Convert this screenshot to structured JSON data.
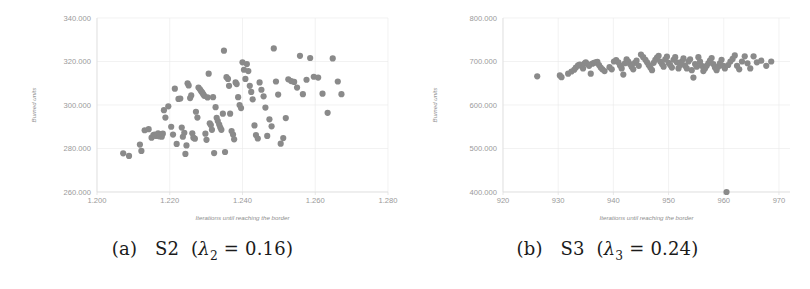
{
  "figure": {
    "panels": [
      {
        "id": "panel-a",
        "caption_label": "(a)",
        "caption_name": "S2",
        "caption_lambda": "λ",
        "caption_lambda_sub": "2",
        "caption_eq": "= 0.16",
        "caption_full": "(a) S2 (λ2 = 0.16)"
      },
      {
        "id": "panel-b",
        "caption_label": "(b)",
        "caption_name": "S3",
        "caption_lambda": "λ",
        "caption_lambda_sub": "3",
        "caption_eq": "= 0.24",
        "caption_full": "(b) S3 (λ3 = 0.24)"
      }
    ]
  },
  "colors": {
    "point": "#8a8a8a",
    "grid": "#e9e9e9",
    "axis": "#dddddd",
    "tick_text": "#9a9a9a",
    "axis_title_text": "#8d8d8d",
    "caption_text": "#1b1b1b",
    "background": "#ffffff"
  },
  "chart_data": [
    {
      "type": "scatter",
      "panel": "a",
      "title": "",
      "xlabel": "Iterations until reaching the border",
      "ylabel": "Burned units",
      "xlim": [
        1.2,
        1.28
      ],
      "ylim": [
        260.0,
        340.0
      ],
      "xticks": [
        1.2,
        1.22,
        1.24,
        1.26,
        1.28
      ],
      "xticklabels": [
        "1.200",
        "1.220",
        "1.240",
        "1.260",
        "1.280"
      ],
      "yticks": [
        260.0,
        280.0,
        300.0,
        320.0,
        340.0
      ],
      "yticklabels": [
        "260.000",
        "280.000",
        "300.000",
        "320.000",
        "340.000"
      ],
      "grid": true,
      "legend": false,
      "marker_size": 3.1,
      "note": "x values are thousands of iterations (1.200 = 1200); y values are thousands of burned units (260.000 = 260000)",
      "x": [
        1.2072,
        1.2088,
        1.2118,
        1.2122,
        1.2131,
        1.2142,
        1.215,
        1.2155,
        1.2158,
        1.2162,
        1.2166,
        1.2168,
        1.2171,
        1.2173,
        1.2176,
        1.2178,
        1.2181,
        1.2184,
        1.2188,
        1.2196,
        1.2204,
        1.2209,
        1.2214,
        1.2219,
        1.2224,
        1.2229,
        1.2233,
        1.2236,
        1.224,
        1.2243,
        1.2246,
        1.2249,
        1.2252,
        1.2256,
        1.2259,
        1.2262,
        1.2265,
        1.2269,
        1.2272,
        1.2276,
        1.2279,
        1.2283,
        1.2286,
        1.2289,
        1.2292,
        1.2295,
        1.2298,
        1.2301,
        1.2304,
        1.2307,
        1.231,
        1.2313,
        1.2316,
        1.2319,
        1.2322,
        1.2326,
        1.2329,
        1.2332,
        1.2336,
        1.2339,
        1.2342,
        1.2346,
        1.2349,
        1.2352,
        1.2356,
        1.236,
        1.2363,
        1.2366,
        1.237,
        1.2374,
        1.2377,
        1.2381,
        1.2384,
        1.2388,
        1.2392,
        1.2396,
        1.24,
        1.2404,
        1.2408,
        1.2412,
        1.2416,
        1.242,
        1.2424,
        1.2428,
        1.2433,
        1.2437,
        1.2442,
        1.2447,
        1.2452,
        1.2458,
        1.2463,
        1.2468,
        1.2474,
        1.248,
        1.2486,
        1.2492,
        1.2498,
        1.2505,
        1.2512,
        1.2519,
        1.2526,
        1.2534,
        1.2542,
        1.255,
        1.2558,
        1.2566,
        1.2576,
        1.2586,
        1.2596,
        1.2608,
        1.262,
        1.2634,
        1.2648,
        1.2662,
        1.2672
      ],
      "y": [
        277.8,
        276.6,
        281.8,
        278.9,
        288.4,
        288.9,
        285.0,
        286.2,
        286.4,
        285.8,
        286.2,
        287.0,
        285.6,
        286.6,
        286.0,
        285.4,
        286.8,
        297.6,
        294.2,
        299.4,
        290.0,
        286.4,
        307.5,
        282.1,
        302.8,
        303.0,
        289.6,
        285.4,
        287.2,
        277.5,
        281.4,
        310.0,
        309.0,
        303.2,
        304.4,
        287.0,
        285.0,
        284.5,
        296.9,
        294.2,
        308.0,
        307.2,
        306.4,
        305.8,
        305.0,
        304.2,
        286.8,
        284.0,
        303.5,
        314.4,
        291.6,
        290.8,
        288.6,
        303.6,
        277.9,
        299.0,
        294.1,
        292.6,
        291.0,
        289.6,
        288.6,
        296.0,
        325.0,
        278.4,
        312.8,
        312.0,
        308.8,
        296.0,
        288.0,
        286.4,
        284.2,
        310.4,
        309.6,
        303.6,
        300.0,
        298.6,
        319.6,
        316.2,
        312.0,
        318.8,
        315.6,
        308.8,
        306.0,
        302.6,
        290.6,
        286.2,
        284.6,
        310.4,
        307.0,
        304.0,
        298.8,
        285.8,
        293.4,
        290.2,
        326.0,
        310.8,
        304.8,
        282.2,
        284.8,
        294.0,
        311.8,
        311.0,
        310.6,
        308.0,
        322.6,
        305.0,
        311.6,
        321.6,
        313.0,
        312.6,
        305.2,
        296.4,
        321.4,
        310.8,
        305.0
      ]
    },
    {
      "type": "scatter",
      "panel": "b",
      "title": "",
      "xlabel": "Iterations until reaching the border",
      "ylabel": "Burned units",
      "xlim": [
        920,
        972
      ],
      "ylim": [
        400.0,
        800.0
      ],
      "xticks": [
        920,
        930,
        940,
        950,
        960,
        970
      ],
      "xticklabels": [
        "920",
        "930",
        "940",
        "950",
        "960",
        "970"
      ],
      "yticks": [
        400.0,
        500.0,
        600.0,
        700.0,
        800.0
      ],
      "yticklabels": [
        "400.000",
        "500.000",
        "600.000",
        "700.000",
        "800.000"
      ],
      "grid": true,
      "legend": false,
      "marker_size": 3.1,
      "note": "y values are thousands of burned units (700.000 = 700000); one low outlier near x=960.5, y=400.000",
      "x": [
        926.2,
        930.3,
        930.6,
        931.8,
        932.4,
        932.9,
        933.2,
        933.6,
        933.9,
        934.2,
        934.5,
        934.8,
        935.0,
        935.3,
        935.6,
        935.9,
        936.2,
        936.5,
        936.8,
        937.1,
        937.4,
        937.7,
        938.0,
        938.4,
        939.3,
        939.7,
        940.1,
        940.5,
        940.9,
        941.2,
        941.5,
        941.8,
        942.1,
        942.4,
        942.7,
        943.0,
        943.3,
        943.6,
        943.9,
        944.2,
        944.6,
        945.0,
        945.4,
        945.8,
        946.1,
        946.4,
        946.7,
        947.0,
        947.3,
        947.6,
        947.9,
        948.2,
        948.5,
        948.8,
        949.1,
        949.4,
        949.7,
        950.0,
        950.3,
        950.6,
        950.9,
        951.2,
        951.5,
        951.8,
        952.1,
        952.4,
        952.7,
        953.0,
        953.3,
        953.6,
        953.9,
        954.2,
        954.5,
        954.8,
        955.1,
        955.4,
        955.7,
        956.0,
        956.3,
        956.6,
        956.9,
        957.2,
        957.5,
        957.8,
        958.1,
        958.4,
        958.7,
        959.0,
        959.3,
        959.6,
        959.9,
        960.2,
        960.5,
        960.8,
        961.2,
        961.6,
        962.0,
        962.4,
        962.8,
        963.3,
        963.8,
        964.3,
        964.8,
        965.4,
        966.0,
        966.8,
        967.7,
        968.6
      ],
      "y": [
        666.0,
        668.0,
        664.0,
        672.0,
        677.0,
        681.0,
        686.0,
        691.0,
        693.0,
        690.0,
        684.0,
        696.0,
        698.0,
        694.0,
        690.0,
        672.0,
        695.0,
        697.0,
        698.0,
        699.0,
        692.0,
        686.0,
        682.0,
        678.0,
        687.0,
        682.0,
        700.0,
        703.0,
        698.0,
        691.0,
        684.0,
        670.0,
        696.0,
        705.0,
        700.0,
        694.0,
        688.0,
        682.0,
        697.0,
        702.0,
        690.0,
        716.0,
        710.0,
        704.0,
        698.0,
        692.0,
        686.0,
        680.0,
        697.0,
        704.0,
        709.0,
        713.0,
        700.0,
        694.0,
        688.0,
        705.0,
        711.0,
        697.0,
        692.0,
        686.0,
        704.0,
        710.0,
        698.0,
        684.0,
        692.0,
        700.0,
        707.0,
        690.0,
        684.0,
        700.0,
        705.0,
        680.0,
        663.0,
        694.0,
        688.0,
        710.0,
        700.0,
        690.0,
        678.0,
        684.0,
        690.0,
        696.0,
        702.0,
        708.0,
        694.0,
        686.0,
        680.0,
        688.0,
        696.0,
        704.0,
        690.0,
        684.0,
        400.0,
        692.0,
        700.0,
        706.0,
        714.0,
        690.0,
        682.0,
        700.0,
        712.0,
        696.0,
        684.0,
        712.0,
        698.0,
        702.0,
        690.0,
        700.0
      ]
    }
  ]
}
